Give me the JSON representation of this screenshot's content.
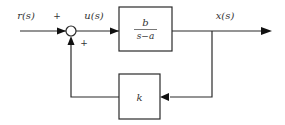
{
  "diagram": {
    "type": "feedback block diagram",
    "signals": {
      "input": "r(s)",
      "control": "u(s)",
      "output": "x(s)"
    },
    "summing_junction": {
      "signs": [
        "+",
        "+"
      ]
    },
    "blocks": {
      "plant": {
        "numerator": "b",
        "denominator": "s−a"
      },
      "feedback": {
        "label": "k"
      }
    },
    "colors": {
      "line": "#2a2a2a",
      "text": "#333333",
      "background": "#ffffff"
    }
  }
}
